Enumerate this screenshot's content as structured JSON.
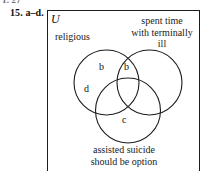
{
  "page": {
    "top_crumb": "1. 27",
    "exercise_label": "15.  a–d."
  },
  "diagram": {
    "type": "venn-three-set",
    "universe_label": "U",
    "sets": [
      {
        "id": "religious",
        "caption": "religious"
      },
      {
        "id": "spent-time",
        "caption": "spent time with terminally ill"
      },
      {
        "id": "assisted",
        "caption": "assisted suicide should be option"
      }
    ],
    "captions": {
      "religious": "religious",
      "spent_time_line1": "spent time",
      "spent_time_line2": "with terminally",
      "spent_time_line3": "ill",
      "assisted_line1": "assisted suicide",
      "assisted_line2": "should be option"
    },
    "region_labels": [
      {
        "id": "region-b-left",
        "text": "b",
        "region": "religious only"
      },
      {
        "id": "region-b-top",
        "text": "b",
        "region": "religious ∩ spent time"
      },
      {
        "id": "region-d-left",
        "text": "d",
        "region": "religious only lower"
      },
      {
        "id": "region-c-bottom",
        "text": "c",
        "region": "assisted suicide only"
      }
    ],
    "geometry": {
      "box": {
        "x": 47,
        "y": 10,
        "w": 153,
        "h": 168
      },
      "circles": [
        {
          "id": "religious",
          "cx": 106.5,
          "cy": 82.5,
          "r": 32.5
        },
        {
          "id": "spent-time",
          "cx": 149.5,
          "cy": 82.5,
          "r": 32.5
        },
        {
          "id": "assisted",
          "cx": 128.0,
          "cy": 110.5,
          "r": 32.5
        }
      ]
    },
    "colors": {
      "stroke": "#1d1d1d",
      "text": "#1a1a1a",
      "background": "#ffffff"
    }
  }
}
